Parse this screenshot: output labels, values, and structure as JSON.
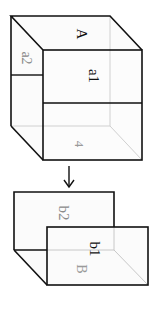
{
  "diagram": {
    "orientation": "rotated 90 degrees clockwise",
    "colors": {
      "solid_line": "#111111",
      "hidden_line": "#c8c8c8",
      "label_dark": "#111111",
      "label_light": "#8a8a8a",
      "face_fill": "#fafafa"
    },
    "top_figure": {
      "name": "cube",
      "labels": {
        "top_face": "A",
        "front_upper": "a1",
        "side_upper": "a2",
        "bottom_face": "4"
      }
    },
    "arrow": {
      "direction": "down",
      "symbol": "↓"
    },
    "bottom_figure": {
      "name": "folded-sheets",
      "labels": {
        "back_sheet": "b2",
        "front_sheet": "b1",
        "floor": "B"
      }
    }
  }
}
